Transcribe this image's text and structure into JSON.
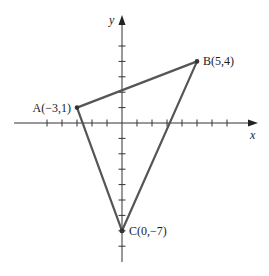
{
  "diagram": {
    "type": "coordinate-plane-triangle",
    "axes": {
      "x_label": "x",
      "y_label": "y",
      "x_ticks": [
        -5,
        -4,
        -3,
        -2,
        -1,
        1,
        2,
        3,
        4,
        5,
        6,
        7
      ],
      "y_ticks": [
        5,
        4,
        3,
        2,
        1,
        -1,
        -2,
        -3,
        -4,
        -5,
        -6,
        -7,
        -8
      ]
    },
    "points": [
      {
        "name": "A",
        "x": -3,
        "y": 1,
        "label": "A(−3,1)"
      },
      {
        "name": "B",
        "x": 5,
        "y": 4,
        "label": "B(5,4)"
      },
      {
        "name": "C",
        "x": 0,
        "y": -7,
        "label": "C(0,−7)"
      }
    ],
    "colors": {
      "triangle": "#555555",
      "axes": "#333333"
    }
  }
}
